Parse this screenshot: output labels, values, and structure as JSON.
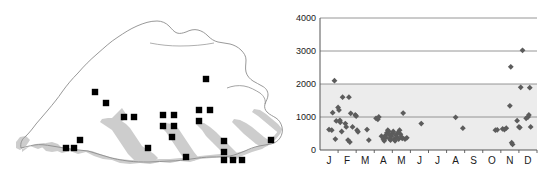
{
  "figure": {
    "background": "#ffffff",
    "panels": [
      "distribution-map",
      "elevation-phenology-scatter"
    ]
  },
  "map": {
    "name": "Bhutan distribution map",
    "outline_color": "#7a7a7a",
    "shading_color": "#cccccc",
    "point_color": "#000000",
    "point_shape": "square",
    "point_count": 27,
    "points": [
      {
        "x": 95,
        "y": 92
      },
      {
        "x": 106,
        "y": 103
      },
      {
        "x": 124,
        "y": 117
      },
      {
        "x": 134,
        "y": 117
      },
      {
        "x": 163,
        "y": 115
      },
      {
        "x": 163,
        "y": 126
      },
      {
        "x": 174,
        "y": 115
      },
      {
        "x": 174,
        "y": 126
      },
      {
        "x": 172,
        "y": 137
      },
      {
        "x": 206,
        "y": 79
      },
      {
        "x": 199,
        "y": 110
      },
      {
        "x": 210,
        "y": 110
      },
      {
        "x": 199,
        "y": 121
      },
      {
        "x": 80,
        "y": 140
      },
      {
        "x": 66,
        "y": 148
      },
      {
        "x": 74,
        "y": 148
      },
      {
        "x": 148,
        "y": 148
      },
      {
        "x": 186,
        "y": 157
      },
      {
        "x": 224,
        "y": 141
      },
      {
        "x": 224,
        "y": 152
      },
      {
        "x": 224,
        "y": 160
      },
      {
        "x": 233,
        "y": 160
      },
      {
        "x": 242,
        "y": 160
      },
      {
        "x": 271,
        "y": 140
      }
    ]
  },
  "chart_data": {
    "type": "scatter",
    "title": "",
    "xlabel": "",
    "ylabel": "",
    "ylim": [
      0,
      4000
    ],
    "yticks": [
      0,
      1000,
      2000,
      3000,
      4000
    ],
    "ytick_labels": [
      "0",
      "1000",
      "2000",
      "3000",
      "4000"
    ],
    "grid": true,
    "gridlines_at": [
      1000,
      2000,
      3000,
      4000
    ],
    "legend": "none",
    "marker": "diamond",
    "marker_color": "#5c5c5c",
    "plot_band_fill": "#ececec",
    "plot_band_range": [
      0,
      2000
    ],
    "categories": [
      "J",
      "F",
      "M",
      "A",
      "M",
      "J",
      "J",
      "A",
      "S",
      "O",
      "N",
      "D"
    ],
    "xtick_labels": [
      "J",
      "F",
      "M",
      "A",
      "M",
      "J",
      "J",
      "A",
      "S",
      "O",
      "N",
      "D"
    ],
    "xlim_months": [
      0.5,
      12.5
    ],
    "points": [
      {
        "month": 1.0,
        "value": 620
      },
      {
        "month": 1.15,
        "value": 600
      },
      {
        "month": 1.2,
        "value": 1130
      },
      {
        "month": 1.3,
        "value": 2100
      },
      {
        "month": 1.35,
        "value": 330
      },
      {
        "month": 1.4,
        "value": 880
      },
      {
        "month": 1.5,
        "value": 1290
      },
      {
        "month": 1.55,
        "value": 1210
      },
      {
        "month": 1.6,
        "value": 900
      },
      {
        "month": 1.62,
        "value": 840
      },
      {
        "month": 1.7,
        "value": 560
      },
      {
        "month": 1.75,
        "value": 1600
      },
      {
        "month": 1.9,
        "value": 800
      },
      {
        "month": 1.95,
        "value": 700
      },
      {
        "month": 2.05,
        "value": 300
      },
      {
        "month": 2.1,
        "value": 1600
      },
      {
        "month": 2.15,
        "value": 240
      },
      {
        "month": 2.2,
        "value": 1110
      },
      {
        "month": 2.3,
        "value": 700
      },
      {
        "month": 2.45,
        "value": 1060
      },
      {
        "month": 2.5,
        "value": 1030
      },
      {
        "month": 2.55,
        "value": 600
      },
      {
        "month": 2.6,
        "value": 550
      },
      {
        "month": 3.1,
        "value": 620
      },
      {
        "month": 3.2,
        "value": 300
      },
      {
        "month": 3.6,
        "value": 960
      },
      {
        "month": 3.7,
        "value": 930
      },
      {
        "month": 3.75,
        "value": 1000
      },
      {
        "month": 3.9,
        "value": 420
      },
      {
        "month": 4.0,
        "value": 330
      },
      {
        "month": 4.05,
        "value": 280
      },
      {
        "month": 4.1,
        "value": 430
      },
      {
        "month": 4.15,
        "value": 380
      },
      {
        "month": 4.2,
        "value": 520
      },
      {
        "month": 4.25,
        "value": 600
      },
      {
        "month": 4.3,
        "value": 560
      },
      {
        "month": 4.32,
        "value": 470
      },
      {
        "month": 4.35,
        "value": 340
      },
      {
        "month": 4.4,
        "value": 300
      },
      {
        "month": 4.45,
        "value": 420
      },
      {
        "month": 4.5,
        "value": 500
      },
      {
        "month": 4.55,
        "value": 560
      },
      {
        "month": 4.6,
        "value": 330
      },
      {
        "month": 4.65,
        "value": 280
      },
      {
        "month": 4.7,
        "value": 450
      },
      {
        "month": 4.75,
        "value": 390
      },
      {
        "month": 4.8,
        "value": 520
      },
      {
        "month": 4.85,
        "value": 330
      },
      {
        "month": 4.9,
        "value": 600
      },
      {
        "month": 4.95,
        "value": 480
      },
      {
        "month": 5.0,
        "value": 400
      },
      {
        "month": 5.05,
        "value": 350
      },
      {
        "month": 5.1,
        "value": 1120
      },
      {
        "month": 5.2,
        "value": 330
      },
      {
        "month": 5.3,
        "value": 370
      },
      {
        "month": 6.1,
        "value": 800
      },
      {
        "month": 8.0,
        "value": 990
      },
      {
        "month": 8.4,
        "value": 660
      },
      {
        "month": 10.2,
        "value": 600
      },
      {
        "month": 10.3,
        "value": 610
      },
      {
        "month": 10.6,
        "value": 640
      },
      {
        "month": 10.7,
        "value": 620
      },
      {
        "month": 10.8,
        "value": 660
      },
      {
        "month": 11.0,
        "value": 1340
      },
      {
        "month": 11.05,
        "value": 2520
      },
      {
        "month": 11.1,
        "value": 220
      },
      {
        "month": 11.15,
        "value": 170
      },
      {
        "month": 11.4,
        "value": 890
      },
      {
        "month": 11.5,
        "value": 700
      },
      {
        "month": 11.55,
        "value": 680
      },
      {
        "month": 11.6,
        "value": 1900
      },
      {
        "month": 11.7,
        "value": 3020
      },
      {
        "month": 11.9,
        "value": 960
      },
      {
        "month": 12.0,
        "value": 1000
      },
      {
        "month": 12.05,
        "value": 1060
      },
      {
        "month": 12.1,
        "value": 1890
      },
      {
        "month": 12.15,
        "value": 700
      }
    ]
  }
}
